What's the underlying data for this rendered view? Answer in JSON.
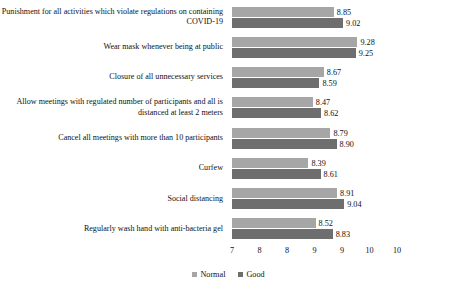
{
  "chart_data": {
    "type": "bar",
    "orientation": "horizontal",
    "title": "",
    "xlabel": "",
    "ylabel": "",
    "xlim": [
      7,
      10
    ],
    "grid": false,
    "legend_position": "bottom-center",
    "tick_labels": [
      "7",
      "8",
      "8",
      "9",
      "9",
      "10",
      "10"
    ],
    "tick_values": [
      7,
      7.5,
      8,
      8.5,
      9,
      9.5,
      10
    ],
    "categories": [
      "Punishment for all activities which violate regulations on containing COVID-19",
      "Wear mask whenever being at public",
      "Closure of all unnecessary services",
      "Allow meetings with regulated number of participants and all is distanced at least 2 meters",
      "Cancel all meetings with more than 10 participants",
      "Curfew",
      "Social distancing",
      "Regularly wash hand with anti-bacteria gel"
    ],
    "series": [
      {
        "name": "Normal",
        "color": "#a6a6a6",
        "values": [
          8.85,
          9.28,
          8.67,
          8.47,
          8.79,
          8.39,
          8.91,
          8.52
        ],
        "labels": [
          "8.85",
          "9.28",
          "8.67",
          "8.47",
          "8.79",
          "8.39",
          "8.91",
          "8.52"
        ]
      },
      {
        "name": "Good",
        "color": "#6e6e6e",
        "values": [
          9.02,
          9.25,
          8.59,
          8.62,
          8.9,
          8.61,
          9.04,
          8.83
        ],
        "labels": [
          "9.02",
          "9.25",
          "8.59",
          "8.62",
          "8.90",
          "8.61",
          "9.04",
          "8.83"
        ]
      }
    ]
  },
  "legend": {
    "items": [
      {
        "label": "Normal",
        "color": "#a6a6a6"
      },
      {
        "label": "Good",
        "color": "#6e6e6e"
      }
    ]
  }
}
